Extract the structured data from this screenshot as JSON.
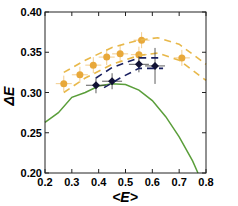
{
  "chart_data": {
    "type": "line",
    "title": "",
    "xlabel": "<E>",
    "ylabel": "ΔE",
    "xlim": [
      0.2,
      0.8
    ],
    "ylim": [
      0.2,
      0.4
    ],
    "xticks": [
      "0.2",
      "0.3",
      "0.4",
      "0.5",
      "0.6",
      "0.7",
      "0.8"
    ],
    "yticks": [
      "0.20",
      "0.25",
      "0.30",
      "0.35",
      "0.40"
    ],
    "grid": false,
    "legend": null,
    "series": [
      {
        "name": "green-curve",
        "color": "#5a9e3a",
        "style": "solid",
        "x": [
          0.2,
          0.25,
          0.3,
          0.35,
          0.4,
          0.45,
          0.5,
          0.55,
          0.6,
          0.65,
          0.7,
          0.75,
          0.77
        ],
        "y": [
          0.263,
          0.275,
          0.294,
          0.3,
          0.308,
          0.311,
          0.31,
          0.303,
          0.29,
          0.27,
          0.245,
          0.215,
          0.2
        ]
      },
      {
        "name": "orange-data",
        "color": "#e8a83a",
        "style": "markers",
        "x": [
          0.27,
          0.33,
          0.38,
          0.43,
          0.48,
          0.55,
          0.56,
          0.71
        ],
        "y": [
          0.311,
          0.322,
          0.334,
          0.344,
          0.348,
          0.347,
          0.365,
          0.343
        ]
      },
      {
        "name": "orange-band-upper",
        "color": "#e8b84a",
        "style": "dashed",
        "x": [
          0.27,
          0.35,
          0.45,
          0.55,
          0.62,
          0.7,
          0.8
        ],
        "y": [
          0.325,
          0.34,
          0.356,
          0.365,
          0.368,
          0.36,
          0.335
        ]
      },
      {
        "name": "orange-band-lower",
        "color": "#e8b84a",
        "style": "dashed",
        "x": [
          0.27,
          0.35,
          0.45,
          0.55,
          0.62,
          0.7,
          0.8
        ],
        "y": [
          0.3,
          0.318,
          0.335,
          0.346,
          0.349,
          0.34,
          0.315
        ]
      },
      {
        "name": "black-data",
        "color": "#111133",
        "style": "markers",
        "x": [
          0.39,
          0.45,
          0.55,
          0.61
        ],
        "y": [
          0.309,
          0.314,
          0.335,
          0.333
        ]
      },
      {
        "name": "navy-band-upper",
        "color": "#1a2060",
        "style": "dashed",
        "x": [
          0.39,
          0.45,
          0.55,
          0.63
        ],
        "y": [
          0.318,
          0.331,
          0.343,
          0.343
        ]
      },
      {
        "name": "navy-band-lower",
        "color": "#1a2060",
        "style": "dashed",
        "x": [
          0.42,
          0.48,
          0.55,
          0.64
        ],
        "y": [
          0.306,
          0.318,
          0.33,
          0.33
        ]
      }
    ]
  }
}
